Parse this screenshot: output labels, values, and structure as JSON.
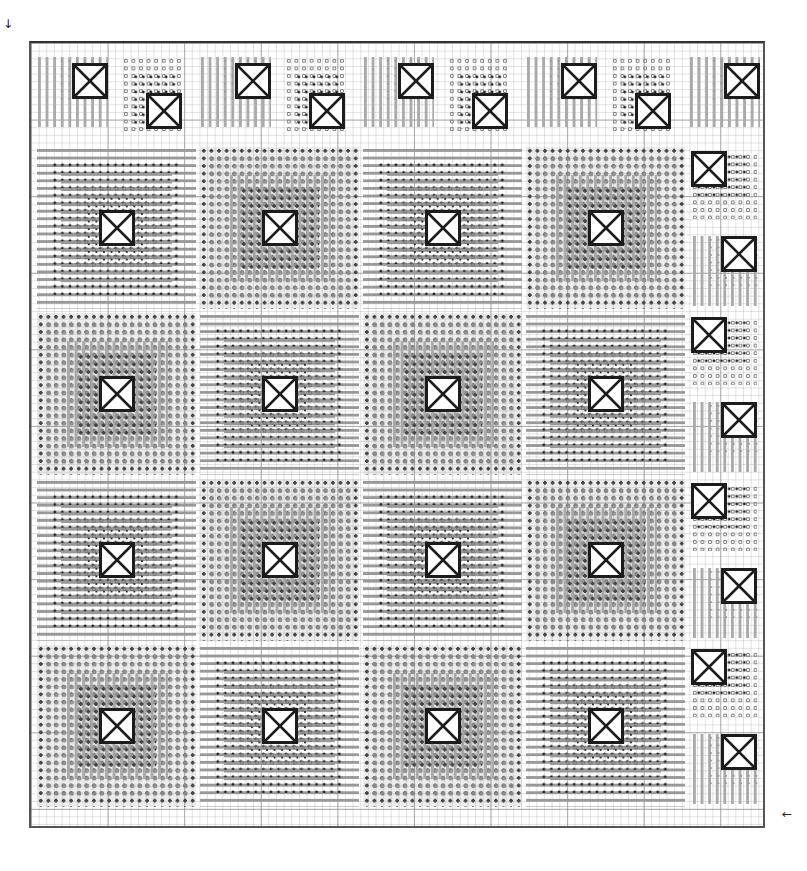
{
  "chart": {
    "type": "cross-stitch-pattern-chart",
    "grid": {
      "minor_cell_px": 7.66,
      "major_every": 10
    },
    "markers": {
      "top_left_arrow": "↓",
      "bottom_right_arrow": "←"
    },
    "main_blocks": {
      "rows": 4,
      "cols": 4,
      "layout": [
        [
          "light",
          "dark",
          "light",
          "dark"
        ],
        [
          "dark",
          "light",
          "dark",
          "light"
        ],
        [
          "light",
          "dark",
          "light",
          "dark"
        ],
        [
          "dark",
          "light",
          "dark",
          "light"
        ]
      ],
      "center_symbol": "boxed-x"
    },
    "top_border": {
      "count": 9,
      "items": [
        "circles-box-up",
        "dots-box-down",
        "cross-box-up",
        "dots-box-down",
        "cross-box-up",
        "dots-box-down",
        "cross-box-up",
        "dots-box-down",
        "cross-box-up"
      ]
    },
    "right_border": {
      "count": 8,
      "items": [
        "dots-box-left",
        "cross-box-right",
        "dots-box-left",
        "cross-box-right",
        "dots-box-left",
        "cross-box-right",
        "dots-box-left",
        "cross-box-right"
      ]
    },
    "colors": {
      "frame": "#333333",
      "symbol_dark": "#222222",
      "symbol_grey": "#888888",
      "symbol_light": "#aaaaaa",
      "background": "#ffffff"
    }
  }
}
